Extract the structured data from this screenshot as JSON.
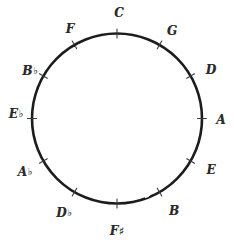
{
  "diagram": {
    "stroke_color": "#1d1d1d",
    "background_color": "#ffffff",
    "circle": {
      "center_x": 117,
      "center_y": 118.5,
      "radius": 85,
      "stroke_width": 2.6
    },
    "notes": [
      {
        "id": "C",
        "letter": "C",
        "accidental": "",
        "angle_deg": 0,
        "label_x": 119,
        "label_y": 13,
        "tick": true
      },
      {
        "id": "G",
        "letter": "G",
        "accidental": "",
        "angle_deg": 30,
        "label_x": 172,
        "label_y": 31,
        "tick": true
      },
      {
        "id": "D",
        "letter": "D",
        "accidental": "",
        "angle_deg": 60,
        "label_x": 211,
        "label_y": 70,
        "tick": true
      },
      {
        "id": "A",
        "letter": "A",
        "accidental": "",
        "angle_deg": 90,
        "label_x": 221,
        "label_y": 120,
        "tick": true
      },
      {
        "id": "E",
        "letter": "E",
        "accidental": "",
        "angle_deg": 120,
        "label_x": 211,
        "label_y": 170,
        "tick": true
      },
      {
        "id": "B",
        "letter": "B",
        "accidental": "",
        "angle_deg": 150,
        "label_x": 174,
        "label_y": 211,
        "tick": true
      },
      {
        "id": "Fs",
        "letter": "F",
        "accidental": "♯",
        "angle_deg": 180,
        "label_x": 117,
        "label_y": 231,
        "tick": true
      },
      {
        "id": "Db",
        "letter": "D",
        "accidental": "♭",
        "angle_deg": 210,
        "label_x": 64,
        "label_y": 213,
        "tick": true
      },
      {
        "id": "Ab",
        "letter": "A",
        "accidental": "♭",
        "angle_deg": 240,
        "label_x": 25,
        "label_y": 172,
        "tick": true
      },
      {
        "id": "Eb",
        "letter": "E",
        "accidental": "♭",
        "angle_deg": 270,
        "label_x": 16,
        "label_y": 114,
        "tick": true
      },
      {
        "id": "Bb",
        "letter": "B",
        "accidental": "♭",
        "angle_deg": 300,
        "label_x": 30,
        "label_y": 71,
        "tick": true
      },
      {
        "id": "F",
        "letter": "F",
        "accidental": "",
        "angle_deg": 330,
        "label_x": 70,
        "label_y": 29,
        "tick": true
      }
    ]
  }
}
